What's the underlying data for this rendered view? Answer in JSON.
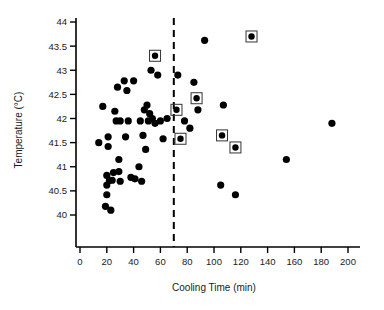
{
  "chart_data": {
    "type": "scatter",
    "title": "",
    "xlabel": "Cooling Time (min)",
    "ylabel": "Temperature (°C)",
    "xlim": [
      0,
      210
    ],
    "ylim": [
      39.6,
      44.2
    ],
    "xticks": [
      0,
      20,
      40,
      60,
      80,
      100,
      120,
      140,
      160,
      180,
      200
    ],
    "xticklabels": [
      "0",
      "20",
      "40",
      "60",
      "80",
      "100",
      "120",
      "140",
      "160",
      "180",
      "200"
    ],
    "yticks": [
      40,
      40.5,
      41,
      41.5,
      42,
      42.5,
      43,
      43.5,
      44
    ],
    "yticklabels": [
      "40",
      "40.5",
      "41",
      "41.5",
      "42",
      "42.5",
      "43",
      "43.5",
      "44"
    ],
    "grid": false,
    "legend": null,
    "annotations": [
      {
        "name": "vertical-reference-line",
        "type": "vline",
        "x": 70,
        "style": "dashed",
        "color": "#000000"
      }
    ],
    "marker_styles": {
      "plain": {
        "name": "plain-dot",
        "shape": "filled-circle",
        "color": "#000000",
        "size": 3.6
      },
      "boxed": {
        "name": "boxed-dot",
        "shape": "filled-circle-in-square",
        "color": "#000000",
        "box_color": "#333333",
        "size": 3.2
      }
    },
    "series": [
      {
        "name": "Plain observations",
        "marker": "plain",
        "points": [
          [
            14,
            41.5
          ],
          [
            17,
            42.25
          ],
          [
            19,
            40.18
          ],
          [
            20,
            40.82
          ],
          [
            20,
            40.62
          ],
          [
            20,
            40.42
          ],
          [
            21,
            41.62
          ],
          [
            21,
            41.42
          ],
          [
            22,
            40.72
          ],
          [
            23,
            40.1
          ],
          [
            24,
            40.72
          ],
          [
            25,
            40.88
          ],
          [
            26,
            42.15
          ],
          [
            27,
            41.95
          ],
          [
            28,
            42.65
          ],
          [
            29,
            41.15
          ],
          [
            29,
            40.9
          ],
          [
            30,
            41.95
          ],
          [
            30,
            40.7
          ],
          [
            33,
            42.78
          ],
          [
            34,
            41.62
          ],
          [
            35,
            42.58
          ],
          [
            36,
            41.95
          ],
          [
            38,
            40.78
          ],
          [
            40,
            42.78
          ],
          [
            41,
            40.75
          ],
          [
            44,
            41.0
          ],
          [
            45,
            41.95
          ],
          [
            46,
            40.7
          ],
          [
            47,
            41.65
          ],
          [
            48,
            42.18
          ],
          [
            49,
            41.36
          ],
          [
            50,
            42.28
          ],
          [
            51,
            41.95
          ],
          [
            52,
            42.1
          ],
          [
            53,
            43.0
          ],
          [
            54,
            42.0
          ],
          [
            56,
            41.9
          ],
          [
            58,
            42.9
          ],
          [
            60,
            41.95
          ],
          [
            62,
            41.58
          ],
          [
            65,
            42.0
          ],
          [
            73,
            42.9
          ],
          [
            78,
            41.95
          ],
          [
            82,
            41.8
          ],
          [
            85,
            42.75
          ],
          [
            88,
            42.18
          ],
          [
            93,
            43.62
          ],
          [
            105,
            40.62
          ],
          [
            107,
            42.28
          ],
          [
            116,
            40.42
          ],
          [
            154,
            41.15
          ],
          [
            188,
            41.9
          ]
        ]
      },
      {
        "name": "Highlighted observations",
        "marker": "boxed",
        "points": [
          [
            56,
            43.3
          ],
          [
            72,
            42.18
          ],
          [
            75,
            41.58
          ],
          [
            87,
            42.42
          ],
          [
            106,
            41.65
          ],
          [
            116,
            41.4
          ],
          [
            128,
            43.7
          ]
        ]
      }
    ]
  }
}
